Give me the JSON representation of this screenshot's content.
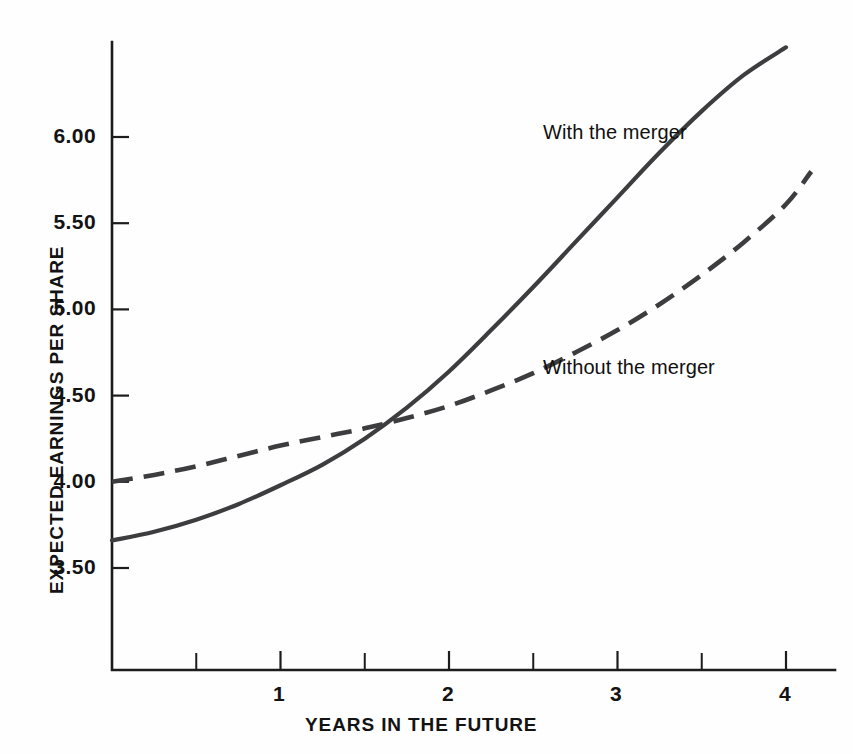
{
  "chart_data": {
    "type": "line",
    "title": "",
    "subtitle": "",
    "xlabel": "YEARS IN THE FUTURE",
    "ylabel": "EXPECTED EARNINGS PER SHARE",
    "xlim": [
      0,
      4.15
    ],
    "ylim": [
      3.1,
      6.6
    ],
    "xticks": [
      0.5,
      1,
      1.5,
      2,
      2.5,
      3,
      3.5,
      4
    ],
    "xtick_labels": [
      "",
      "1",
      "",
      "2",
      "",
      "3",
      "",
      "4"
    ],
    "yticks": [
      3.5,
      4.0,
      4.5,
      5.0,
      5.5,
      6.0
    ],
    "ytick_labels": [
      "3.50",
      "4.00",
      "4.50",
      "5.00",
      "5.50",
      "6.00"
    ],
    "grid": false,
    "legend_position": "inline-annotations",
    "x": [
      0,
      0.25,
      0.5,
      0.75,
      1.0,
      1.25,
      1.5,
      1.75,
      2.0,
      2.25,
      2.5,
      2.75,
      3.0,
      3.25,
      3.5,
      3.75,
      4.0,
      4.15
    ],
    "series": [
      {
        "name": "With the merger",
        "style": "solid",
        "color": "#3d3d40",
        "values": [
          3.66,
          3.71,
          3.78,
          3.87,
          3.98,
          4.1,
          4.25,
          4.43,
          4.64,
          4.88,
          5.13,
          5.39,
          5.65,
          5.91,
          6.15,
          6.36,
          6.52,
          null
        ]
      },
      {
        "name": "Without the merger",
        "style": "dashed",
        "color": "#3d3d40",
        "values": [
          4.0,
          4.04,
          4.09,
          4.15,
          4.21,
          4.26,
          4.31,
          4.37,
          4.44,
          4.53,
          4.63,
          4.75,
          4.88,
          5.03,
          5.2,
          5.39,
          5.61,
          5.8
        ]
      }
    ],
    "annotations": [
      {
        "text": "With the merger",
        "x": 3.0,
        "y": 6.05
      },
      {
        "text": "Without the merger",
        "x": 3.05,
        "y": 4.75
      }
    ],
    "crossover": {
      "x": 1.48,
      "y": 4.3
    }
  },
  "axis": {
    "x_title": "YEARS IN THE FUTURE",
    "y_title": "EXPECTED EARNINGS PER SHARE"
  },
  "labels": {
    "y": [
      "6.00",
      "5.50",
      "5.00",
      "4.50",
      "4.00",
      "3.50"
    ],
    "x": [
      "1",
      "2",
      "3",
      "4"
    ]
  },
  "annotations": {
    "with_merger": "With the merger",
    "without_merger": "Without the merger"
  },
  "colors": {
    "ink": "#1c1c1c",
    "series": "#3d3d40",
    "background": "#fefefe"
  }
}
